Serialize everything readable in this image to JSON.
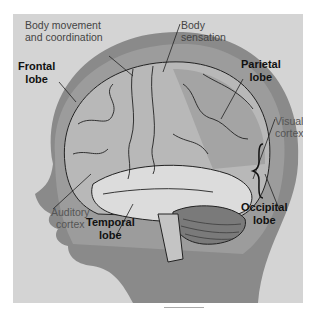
{
  "diagram": {
    "labels": {
      "body_movement": [
        "Body movement",
        "and coordination"
      ],
      "body_sensation": [
        "Body",
        "sensation"
      ],
      "frontal": [
        "Frontal",
        "lobe"
      ],
      "parietal": [
        "Parietal",
        "lobe"
      ],
      "visual": [
        "Visual",
        "cortex"
      ],
      "auditory": [
        "Auditory",
        "cortex"
      ],
      "temporal": [
        "Temporal",
        "lobe"
      ],
      "occipital": [
        "Occipital",
        "lobe"
      ]
    },
    "colors": {
      "background": "#d4d4d4",
      "head": "#8a8a8a",
      "skull": "#9c9c9c",
      "brain": "#b8b8b8",
      "temporal": "#dcdcdc",
      "cerebellum": "#7a7a7a",
      "lines": "#222222"
    }
  }
}
